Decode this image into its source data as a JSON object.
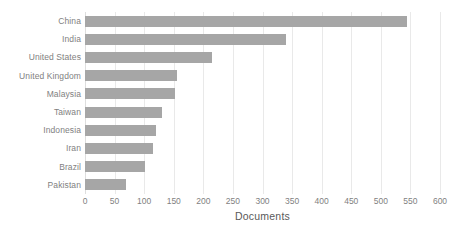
{
  "chart_data": {
    "type": "bar",
    "orientation": "horizontal",
    "title": "",
    "xlabel": "Documents",
    "ylabel": "",
    "xlim": [
      0,
      600
    ],
    "xticks": [
      0,
      50,
      100,
      150,
      200,
      250,
      300,
      350,
      400,
      450,
      500,
      550,
      600
    ],
    "grid": true,
    "legend": null,
    "bar_color": "#a6a6a6",
    "text_color": "#7f7f7f",
    "categories": [
      "China",
      "India",
      "United States",
      "United Kingdom",
      "Malaysia",
      "Taiwan",
      "Indonesia",
      "Iran",
      "Brazil",
      "Pakistan"
    ],
    "values": [
      545,
      340,
      215,
      155,
      152,
      130,
      120,
      115,
      102,
      70
    ]
  }
}
